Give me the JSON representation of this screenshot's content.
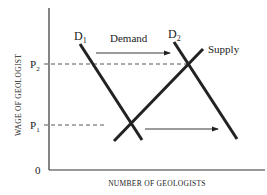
{
  "diagram": {
    "type": "supply-demand",
    "axes": {
      "y_label": "WAGE OF GEOLOGIST",
      "x_label": "NUMBER OF GEOLOGISTS",
      "origin_label": "0",
      "y_ticks": [
        {
          "label": "P",
          "sub": "2",
          "y": 64
        },
        {
          "label": "P",
          "sub": "1",
          "y": 125
        }
      ]
    },
    "curves": {
      "d1": {
        "label": "D",
        "sub": "1"
      },
      "d2": {
        "label": "D",
        "sub": "2"
      },
      "supply": {
        "label": "Supply"
      }
    },
    "annotations": {
      "demand_shift_label": "Demand"
    },
    "colors": {
      "line": "#222222",
      "axis": "#333333",
      "dashed": "#444444"
    }
  }
}
